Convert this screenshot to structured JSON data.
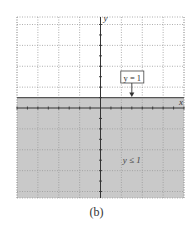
{
  "chart_data": {
    "type": "area",
    "title": "",
    "caption": "(b)",
    "xlabel": "x",
    "ylabel": "y",
    "xlim": [
      -8,
      8
    ],
    "ylim": [
      -8.5,
      8.8
    ],
    "grid": true,
    "grid_major_step": 2,
    "tick_step": 1,
    "boundary": {
      "equation": "y = 1",
      "value": 1,
      "style": "solid"
    },
    "shaded_region": {
      "inequality": "y ≤ 1",
      "direction": "below",
      "color": "#c8c8c8"
    },
    "annotations": [
      {
        "text": "y = 1",
        "x": 3,
        "y": 2.6,
        "boxed": true,
        "arrow_to": [
          3,
          1
        ]
      },
      {
        "text": "y ≤ 1",
        "x": 3,
        "y": -6
      }
    ]
  },
  "colors": {
    "shade": "#c9c9c9",
    "grid": "#9a9a9a",
    "axis": "#333333",
    "boundary": "#555555",
    "background": "#ffffff"
  }
}
